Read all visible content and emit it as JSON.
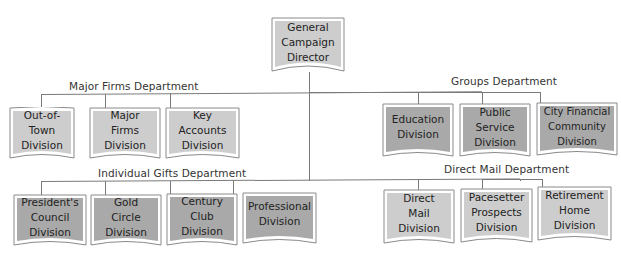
{
  "director": {
    "lines": [
      "General",
      "Campaign",
      "Director"
    ]
  },
  "departments": {
    "major_firms": {
      "label": "Major Firms Department",
      "divisions": [
        {
          "lines": [
            "Out-of-",
            "Town",
            "Division"
          ]
        },
        {
          "lines": [
            "Major",
            "Firms",
            "Division"
          ]
        },
        {
          "lines": [
            "Key",
            "Accounts",
            "Division"
          ]
        }
      ]
    },
    "groups": {
      "label": "Groups Department",
      "divisions": [
        {
          "lines": [
            "Education",
            "Division"
          ]
        },
        {
          "lines": [
            "Public",
            "Service",
            "Division"
          ]
        },
        {
          "lines": [
            "City Financial",
            "Community",
            "Division"
          ]
        }
      ]
    },
    "individual_gifts": {
      "label": "Individual Gifts Department",
      "divisions": [
        {
          "lines": [
            "President's",
            "Council",
            "Division"
          ]
        },
        {
          "lines": [
            "Gold",
            "Circle",
            "Division"
          ]
        },
        {
          "lines": [
            "Century",
            "Club",
            "Division"
          ]
        },
        {
          "lines": [
            "Professional",
            "Division"
          ]
        }
      ]
    },
    "direct_mail": {
      "label": "Direct Mail Department",
      "divisions": [
        {
          "lines": [
            "Direct",
            "Mail",
            "Division"
          ]
        },
        {
          "lines": [
            "Pacesetter",
            "Prospects",
            "Division"
          ]
        },
        {
          "lines": [
            "Retirement",
            "Home",
            "Division"
          ]
        }
      ]
    }
  },
  "colors": {
    "light_fill": "#cdcdcd",
    "dark_fill": "#a9a9a9",
    "line": "#7a7a7a",
    "frame": "#8a8a8a"
  }
}
